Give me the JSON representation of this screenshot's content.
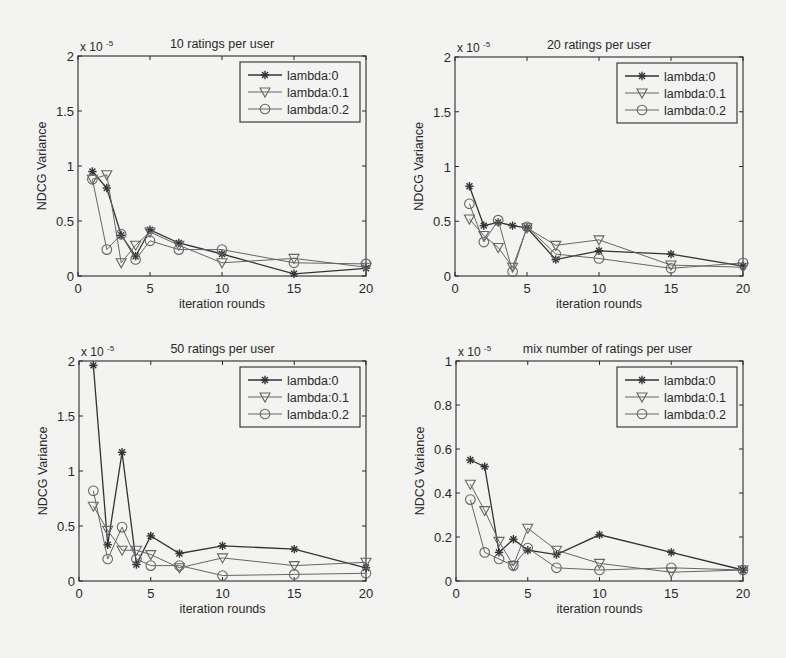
{
  "figure": {
    "x_values": [
      1,
      2,
      3,
      4,
      5,
      7,
      10,
      15,
      20
    ],
    "xlabel": "iteration rounds",
    "ylabel": "NDCG Variance",
    "exponent_label": "x 10",
    "exponent_power": "-5",
    "legend": [
      "lambda:0",
      "lambda:0.1",
      "lambda:0.2"
    ]
  },
  "chart_data": [
    {
      "type": "line",
      "title": "10 ratings per user",
      "xlabel": "iteration rounds",
      "ylabel": "NDCG Variance",
      "y_scale_note": "x 10^-5",
      "xlim": [
        0,
        20
      ],
      "ylim": [
        0,
        2
      ],
      "xticks": [
        0,
        5,
        10,
        15,
        20
      ],
      "yticks": [
        0,
        0.5,
        1,
        1.5,
        2
      ],
      "ytick_labels": [
        "0",
        "0.5",
        "1",
        "1.5",
        "2"
      ],
      "legend_position": "upper right",
      "x": [
        1,
        2,
        3,
        4,
        5,
        7,
        10,
        15,
        20
      ],
      "series": [
        {
          "name": "lambda:0",
          "marker": "asterisk",
          "values": [
            0.95,
            0.8,
            0.37,
            0.18,
            0.42,
            0.3,
            0.2,
            0.02,
            0.07
          ]
        },
        {
          "name": "lambda:0.1",
          "marker": "triangle-down",
          "values": [
            0.88,
            0.92,
            0.12,
            0.28,
            0.4,
            0.28,
            0.12,
            0.16,
            0.08
          ]
        },
        {
          "name": "lambda:0.2",
          "marker": "circle",
          "values": [
            0.88,
            0.24,
            0.38,
            0.15,
            0.32,
            0.24,
            0.24,
            0.12,
            0.11
          ]
        }
      ]
    },
    {
      "type": "line",
      "title": "20 ratings per user",
      "xlabel": "iteration rounds",
      "ylabel": "NDCG Variance",
      "y_scale_note": "x 10^-5",
      "xlim": [
        0,
        20
      ],
      "ylim": [
        0,
        2
      ],
      "xticks": [
        0,
        5,
        10,
        15,
        20
      ],
      "yticks": [
        0,
        0.5,
        1,
        1.5,
        2
      ],
      "ytick_labels": [
        "0",
        "0.5",
        "1",
        "1.5",
        "2"
      ],
      "legend_position": "upper right",
      "x": [
        1,
        2,
        3,
        4,
        5,
        7,
        10,
        15,
        20
      ],
      "series": [
        {
          "name": "lambda:0",
          "marker": "asterisk",
          "values": [
            0.82,
            0.46,
            0.49,
            0.46,
            0.44,
            0.15,
            0.23,
            0.2,
            0.09
          ]
        },
        {
          "name": "lambda:0.1",
          "marker": "triangle-down",
          "values": [
            0.52,
            0.37,
            0.26,
            0.08,
            0.44,
            0.28,
            0.33,
            0.1,
            0.08
          ]
        },
        {
          "name": "lambda:0.2",
          "marker": "circle",
          "values": [
            0.66,
            0.31,
            0.51,
            0.04,
            0.45,
            0.2,
            0.16,
            0.07,
            0.12
          ]
        }
      ]
    },
    {
      "type": "line",
      "title": "50 ratings per user",
      "xlabel": "iteration rounds",
      "ylabel": "NDCG Variance",
      "y_scale_note": "x 10^-5",
      "xlim": [
        0,
        20
      ],
      "ylim": [
        0,
        2
      ],
      "xticks": [
        0,
        5,
        10,
        15,
        20
      ],
      "yticks": [
        0,
        0.5,
        1,
        1.5,
        2
      ],
      "ytick_labels": [
        "0",
        "0.5",
        "1",
        "1.5",
        "2"
      ],
      "legend_position": "upper right",
      "x": [
        1,
        2,
        3,
        4,
        5,
        7,
        10,
        15,
        20
      ],
      "series": [
        {
          "name": "lambda:0",
          "marker": "asterisk",
          "values": [
            1.96,
            0.33,
            1.17,
            0.15,
            0.41,
            0.25,
            0.32,
            0.29,
            0.12
          ]
        },
        {
          "name": "lambda:0.1",
          "marker": "triangle-down",
          "values": [
            0.68,
            0.46,
            0.28,
            0.28,
            0.24,
            0.12,
            0.21,
            0.14,
            0.17
          ]
        },
        {
          "name": "lambda:0.2",
          "marker": "circle",
          "values": [
            0.82,
            0.2,
            0.49,
            0.2,
            0.14,
            0.14,
            0.05,
            0.06,
            0.07
          ]
        }
      ]
    },
    {
      "type": "line",
      "title": "mix number of ratings per user",
      "xlabel": "iteration rounds",
      "ylabel": "NDCG Variance",
      "y_scale_note": "x 10^-5",
      "xlim": [
        0,
        20
      ],
      "ylim": [
        0,
        1
      ],
      "xticks": [
        0,
        5,
        10,
        15,
        20
      ],
      "yticks": [
        0,
        0.2,
        0.4,
        0.6,
        0.8,
        1
      ],
      "ytick_labels": [
        "0",
        "0.2",
        "0.4",
        "0.6",
        "0.8",
        "1"
      ],
      "legend_position": "upper right",
      "x": [
        1,
        2,
        3,
        4,
        5,
        7,
        10,
        15,
        20
      ],
      "series": [
        {
          "name": "lambda:0",
          "marker": "asterisk",
          "values": [
            0.55,
            0.52,
            0.13,
            0.19,
            0.14,
            0.12,
            0.21,
            0.13,
            0.05
          ]
        },
        {
          "name": "lambda:0.1",
          "marker": "triangle-down",
          "values": [
            0.44,
            0.32,
            0.18,
            0.07,
            0.24,
            0.14,
            0.08,
            0.04,
            0.05
          ]
        },
        {
          "name": "lambda:0.2",
          "marker": "circle",
          "values": [
            0.37,
            0.13,
            0.1,
            0.07,
            0.15,
            0.06,
            0.05,
            0.06,
            0.05
          ]
        }
      ]
    }
  ],
  "style": {
    "background": "#f3f3f1",
    "axis_color": "#2a2a2a",
    "series_colors": [
      "#333333",
      "#666666",
      "#666666"
    ]
  }
}
